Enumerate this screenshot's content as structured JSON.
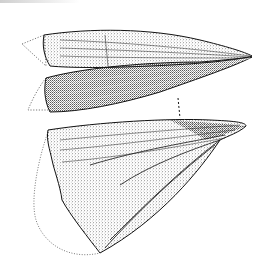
{
  "figure": {
    "views": [
      {
        "name": "upper valve, dorsal view",
        "position": "top"
      },
      {
        "name": "valve, side view",
        "position": "middle"
      },
      {
        "name": "valve, lateral view",
        "position": "bottom"
      }
    ],
    "style": "stippled pen drawing with dotted reconstruction outlines",
    "colors": {
      "ink": "#1a1a1a",
      "background": "#ffffff",
      "dotted": "#555555"
    }
  }
}
